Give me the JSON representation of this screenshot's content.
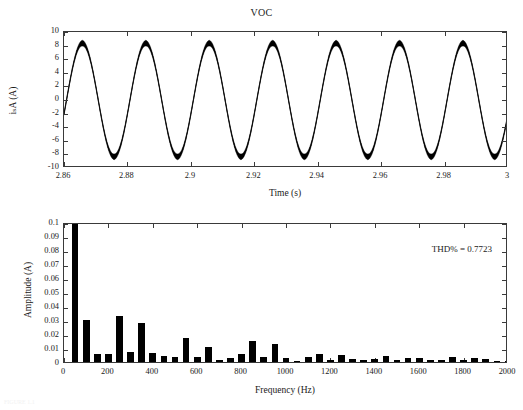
{
  "figure": {
    "caption": "FIGURE 1.1"
  },
  "chart_data": [
    {
      "type": "line",
      "title": "VOC",
      "xlabel": "Time (s)",
      "ylabel": "iₛA (A)",
      "xlim": [
        2.86,
        3.0
      ],
      "ylim": [
        -10,
        10
      ],
      "xticks": [
        "2.86",
        "2.88",
        "2.9",
        "2.92",
        "2.94",
        "2.96",
        "2.98",
        "3"
      ],
      "xtick_values": [
        2.86,
        2.88,
        2.9,
        2.92,
        2.94,
        2.96,
        2.98,
        3.0
      ],
      "yticks": [
        "-10",
        "-8",
        "-6",
        "-4",
        "-2",
        "0",
        "2",
        "4",
        "6",
        "8",
        "10"
      ],
      "ytick_values": [
        -10,
        -8,
        -6,
        -4,
        -2,
        0,
        2,
        4,
        6,
        8,
        10
      ],
      "grid": false,
      "legend": null,
      "series": [
        {
          "name": "i_sA",
          "waveform": "sinusoid",
          "amplitude": 8.35,
          "frequency_hz": 50,
          "phase_rad": -0.25,
          "ripple_amplitude": 0.45,
          "ripple_frequency_hz": 2000,
          "color": "#000000"
        }
      ]
    },
    {
      "type": "bar",
      "title": "",
      "xlabel": "Frequency (Hz)",
      "ylabel": "Amplitude (A)",
      "xlim": [
        0,
        2000
      ],
      "ylim": [
        0,
        0.1
      ],
      "xticks": [
        "0",
        "200",
        "400",
        "600",
        "800",
        "1000",
        "1200",
        "1400",
        "1600",
        "1800",
        "2000"
      ],
      "xtick_values": [
        0,
        200,
        400,
        600,
        800,
        1000,
        1200,
        1400,
        1600,
        1800,
        2000
      ],
      "yticks": [
        "0",
        "0.01",
        "0.02",
        "0.03",
        "0.04",
        "0.05",
        "0.06",
        "0.07",
        "0.08",
        "0.09",
        "0.1"
      ],
      "ytick_values": [
        0,
        0.01,
        0.02,
        0.03,
        0.04,
        0.05,
        0.06,
        0.07,
        0.08,
        0.09,
        0.1
      ],
      "grid": false,
      "bar_width_hz": 30,
      "annotation": "THD% = 0.7723",
      "categories": [
        50,
        100,
        150,
        200,
        250,
        300,
        350,
        400,
        450,
        500,
        550,
        600,
        650,
        700,
        750,
        800,
        850,
        900,
        950,
        1000,
        1050,
        1100,
        1150,
        1200,
        1250,
        1300,
        1350,
        1400,
        1450,
        1500,
        1550,
        1600,
        1650,
        1700,
        1750,
        1800,
        1850,
        1900,
        1950,
        2000
      ],
      "values": [
        0.1,
        0.0303,
        0.0057,
        0.0057,
        0.0332,
        0.0075,
        0.0281,
        0.0063,
        0.0046,
        0.0035,
        0.0168,
        0.0038,
        0.0104,
        0.0017,
        0.0029,
        0.0056,
        0.0149,
        0.0037,
        0.0126,
        0.0027,
        0.0006,
        0.0035,
        0.0058,
        0.0014,
        0.0053,
        0.0019,
        0.0015,
        0.0021,
        0.0046,
        0.0017,
        0.0028,
        0.0027,
        0.0012,
        0.0016,
        0.0037,
        0.0011,
        0.0029,
        0.0018,
        0.0004,
        0.0009
      ],
      "color": "#000000"
    }
  ]
}
